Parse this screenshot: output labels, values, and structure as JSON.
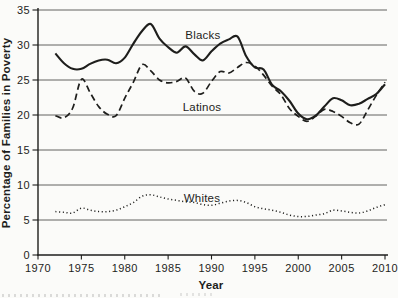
{
  "figure": {
    "background": "#fbfbf9",
    "ink_color": "#1e1e1c",
    "grid_color": "#3c3c3a"
  },
  "chart_data": {
    "type": "line",
    "title": "",
    "xlabel": "Year",
    "ylabel": "Percentage of Families in Poverty",
    "xlim": [
      1970,
      2010
    ],
    "ylim": [
      0,
      35
    ],
    "x_ticks": [
      1970,
      1975,
      1980,
      1985,
      1990,
      1995,
      2000,
      2005,
      2010
    ],
    "y_ticks": [
      0,
      5,
      10,
      15,
      20,
      25,
      30,
      35
    ],
    "grid": "horizontal",
    "legend_position": "inline-labels",
    "x": [
      1972,
      1973,
      1974,
      1975,
      1976,
      1977,
      1978,
      1979,
      1980,
      1981,
      1982,
      1983,
      1984,
      1985,
      1986,
      1987,
      1988,
      1989,
      1990,
      1991,
      1992,
      1993,
      1994,
      1995,
      1996,
      1997,
      1998,
      1999,
      2000,
      2001,
      2002,
      2003,
      2004,
      2005,
      2006,
      2007,
      2008,
      2009,
      2010
    ],
    "series": [
      {
        "name": "Blacks",
        "line_style": "solid",
        "label": {
          "year": 1989,
          "value": 31.4
        },
        "values": [
          28.8,
          27.4,
          26.6,
          26.6,
          27.3,
          27.8,
          27.9,
          27.4,
          28.2,
          30.2,
          32.0,
          33.0,
          30.9,
          29.7,
          28.9,
          29.8,
          28.7,
          27.8,
          29.1,
          30.2,
          30.8,
          31.2,
          28.4,
          26.8,
          26.5,
          24.3,
          23.4,
          22.0,
          20.2,
          19.4,
          19.9,
          21.2,
          22.4,
          22.1,
          21.4,
          21.6,
          22.3,
          23.0,
          24.4
        ]
      },
      {
        "name": "Latinos",
        "line_style": "dashed",
        "label": {
          "year": 1988.9,
          "value": 21.2
        },
        "values": [
          19.9,
          19.6,
          21.0,
          25.1,
          23.2,
          21.2,
          20.1,
          19.9,
          22.4,
          24.7,
          27.2,
          26.3,
          25.0,
          24.6,
          24.8,
          25.3,
          23.4,
          23.1,
          24.8,
          26.2,
          26.0,
          26.8,
          27.5,
          27.0,
          25.7,
          24.1,
          22.9,
          20.9,
          19.8,
          19.1,
          19.8,
          20.8,
          20.5,
          19.8,
          18.9,
          18.7,
          20.7,
          22.8,
          24.7
        ]
      },
      {
        "name": "Whites",
        "line_style": "dotted",
        "label": {
          "year": 1988.9,
          "value": 8.1
        },
        "values": [
          6.2,
          6.1,
          6.0,
          6.7,
          6.4,
          6.2,
          6.2,
          6.4,
          6.9,
          7.5,
          8.4,
          8.6,
          8.3,
          8.0,
          7.8,
          7.6,
          7.5,
          7.2,
          7.1,
          7.4,
          7.7,
          7.8,
          7.5,
          6.9,
          6.6,
          6.4,
          6.1,
          5.7,
          5.5,
          5.5,
          5.7,
          5.9,
          6.4,
          6.3,
          6.1,
          6.0,
          6.3,
          6.8,
          7.2
        ]
      }
    ]
  }
}
